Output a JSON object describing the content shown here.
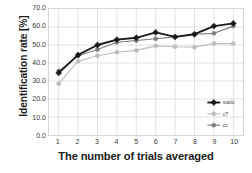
{
  "chart_data": {
    "type": "line",
    "title": "",
    "xlabel": "The number of trials averaged",
    "ylabel": "Identification rate [%]",
    "x": [
      1,
      2,
      3,
      4,
      5,
      6,
      7,
      8,
      9,
      10
    ],
    "xtick_labels": [
      "1",
      "2",
      "3",
      "4",
      "5",
      "6",
      "7",
      "8",
      "9",
      "10"
    ],
    "ytick_labels": [
      "0.0",
      "10.0",
      "20.0",
      "30.0",
      "40.0",
      "50.0",
      "60.0",
      "70.0"
    ],
    "ytick_values": [
      0,
      10,
      20,
      30,
      40,
      50,
      60,
      70
    ],
    "ylim": [
      0,
      70
    ],
    "xlim": [
      0.5,
      10.5
    ],
    "grid": true,
    "legend_position": "center-right",
    "series": [
      {
        "name": "static",
        "color": "#1a1a1a",
        "marker": "diamond",
        "values": [
          34.5,
          44.5,
          50.0,
          53.0,
          54.0,
          57.0,
          54.5,
          56.0,
          60.5,
          62.0
        ]
      },
      {
        "name": "cT",
        "color": "#bdbdbd",
        "marker": "circle",
        "values": [
          28.5,
          41.0,
          44.0,
          46.0,
          47.0,
          49.5,
          49.0,
          48.8,
          50.8,
          50.8
        ]
      },
      {
        "name": "cc",
        "color": "#7d7d7d",
        "marker": "circle",
        "values": [
          35.5,
          44.0,
          47.5,
          51.5,
          52.5,
          53.5,
          54.5,
          56.0,
          56.5,
          60.5
        ]
      }
    ]
  },
  "style": {
    "grid_color": "#e2e2e2",
    "border_color": "#d7d7d7",
    "background": "#ffffff",
    "text_color": "#1d1d1d"
  }
}
